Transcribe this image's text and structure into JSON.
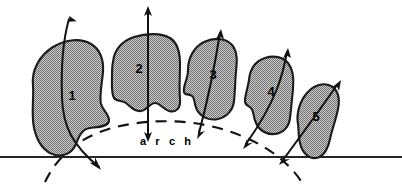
{
  "figure": {
    "background_color": "#ffffff",
    "tooth_fill_color": "#a8a8a8",
    "outline_color": "#1a1a1a",
    "baseline_color": "#262626",
    "arch_label": "a r c h",
    "arch_label_plain": "arch"
  },
  "teeth": [
    {
      "label": "1",
      "label_x": 72,
      "label_y": 100,
      "path": "M 33 86 C 31 70 40 55 53 47 C 66 39 81 38 91 44 C 100 49 104 60 103 72 C 102 84 99 96 101 104 C 103 111 110 115 109 121 C 108 127 97 127 90 128 C 82 129 79 136 76 144 C 72 153 64 157 55 155 C 44 152 37 141 34 128 C 31 113 34 99 33 86 Z",
      "fill": "#a8a8a8"
    },
    {
      "label": "2",
      "label_x": 139,
      "label_y": 73,
      "path": "M 113 62 C 114 50 122 41 134 37 C 147 33 161 33 170 38 C 178 43 180 53 180 64 C 180 76 179 89 180 99 C 181 108 176 113 169 111 C 163 109 160 103 155 103 C 150 103 147 110 141 111 C 134 112 130 106 126 103 C 122 100 117 102 114 98 C 111 93 112 84 112 75 C 112 70 112 66 113 62 Z",
      "fill": "#a8a8a8"
    },
    {
      "label": "3",
      "label_x": 213,
      "label_y": 79,
      "path": "M 188 70 C 188 58 194 47 204 42 C 215 37 226 38 232 45 C 238 52 237 62 236 72 C 235 82 235 93 234 101 C 233 110 227 117 218 119 C 209 121 201 117 197 110 C 194 104 195 98 192 96 C 188 93 185 96 184 92 C 183 87 186 82 187 77 C 188 74 188 72 188 70 Z",
      "fill": "#a8a8a8"
    },
    {
      "label": "4",
      "label_x": 271,
      "label_y": 96,
      "path": "M 249 80 C 250 69 256 61 265 58 C 274 55 283 57 288 63 C 293 69 294 79 293 89 C 292 99 291 110 290 118 C 289 127 283 133 275 134 C 266 135 259 130 256 123 C 253 117 254 111 251 108 C 248 105 245 106 245 101 C 245 95 248 87 249 80 Z",
      "fill": "#a8a8a8"
    },
    {
      "label": "5",
      "label_x": 316,
      "label_y": 121,
      "path": "M 298 124 C 296 113 300 101 307 93 C 314 85 324 82 331 86 C 338 90 340 99 338 109 C 336 119 332 130 330 139 C 328 148 324 157 316 158 C 308 159 302 152 300 143 C 298 136 299 130 298 124 Z",
      "fill": "#a8a8a8"
    }
  ],
  "axis_arrows": [
    {
      "name": "axis-arrow-tooth-1",
      "path": "M 69 19 C 63 40 61 70 62 98 C 63 126 72 145 99 167"
    },
    {
      "name": "axis-arrow-tooth-2",
      "path": "M 148 8 L 148 139"
    },
    {
      "name": "axis-arrow-tooth-3",
      "path": "M 220 31 C 216 58 211 88 199 135"
    },
    {
      "name": "axis-arrow-tooth-4",
      "path": "M 287 50 C 283 74 277 100 244 146"
    },
    {
      "name": "axis-arrow-tooth-5",
      "path": "M 339 83 C 327 100 309 125 281 163"
    }
  ],
  "arch_curve": {
    "name": "dental-arch-dashed-curve",
    "path": "M 45 182 C 58 155 80 137 112 128 C 150 118 192 119 228 131 C 262 142 287 160 301 181",
    "dash_pattern": "11 8"
  },
  "baseline": {
    "name": "occlusal-baseline",
    "x1": 0,
    "y1": 157,
    "x2": 402,
    "y2": 157
  }
}
